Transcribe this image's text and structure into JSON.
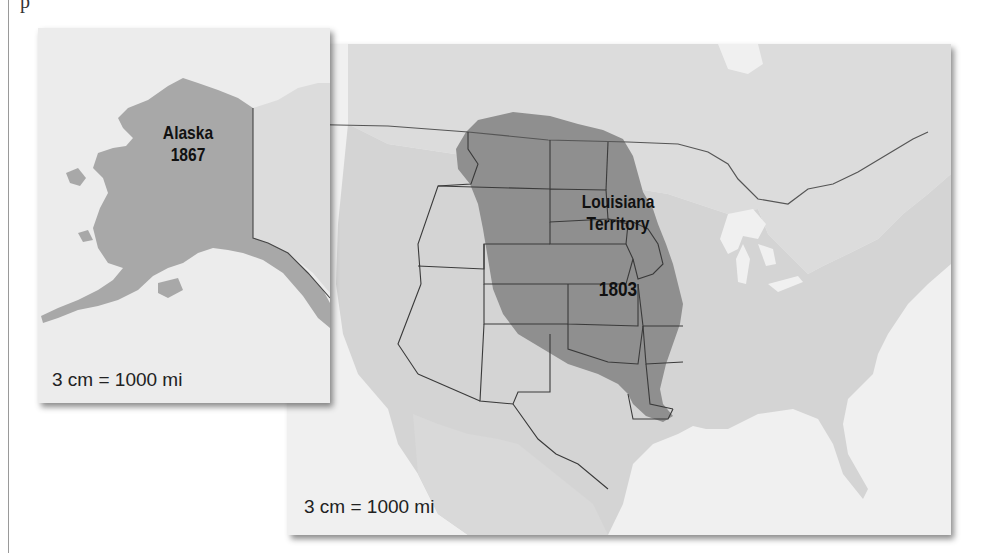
{
  "page": {
    "top_text_fragment": "p"
  },
  "maps": {
    "alaska": {
      "name": "Alaska",
      "year": "1867",
      "scale": "3 cm = 1000 mi"
    },
    "main": {
      "name_line1": "Louisiana",
      "name_line2": "Territory",
      "year": "1803",
      "scale": "3 cm = 1000 mi"
    }
  },
  "colors": {
    "ocean": "#f2f2f2",
    "land": "#d6d6d6",
    "highlight_territory": "#8f8f8f",
    "border": "#3a3a3a",
    "label_text": "#111111"
  }
}
